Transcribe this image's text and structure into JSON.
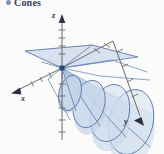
{
  "heading": {
    "bullet_icon": "bullet-dot-icon",
    "text": "Cones"
  },
  "figure": {
    "name": "cones-3d-figure",
    "background_color": "#fbfbfa",
    "fill_color": "#c2d2e8",
    "fill_color_light": "#dbe5f2",
    "stroke_color": "#5d7cab",
    "stroke_color_dark": "#3f5d8e",
    "axis_color": "#6b6b6b",
    "axis_labels": {
      "x": "x",
      "y": "y",
      "z": "z"
    },
    "cone_count": 4,
    "axes": [
      {
        "name": "z-axis",
        "direction": "up",
        "ticks": 9,
        "arrow": true
      },
      {
        "name": "x-axis",
        "direction": "lower-left",
        "ticks": 4,
        "arrow": true
      },
      {
        "name": "y-axis",
        "direction": "lower-right",
        "ticks": 7,
        "arrow": true
      }
    ]
  }
}
